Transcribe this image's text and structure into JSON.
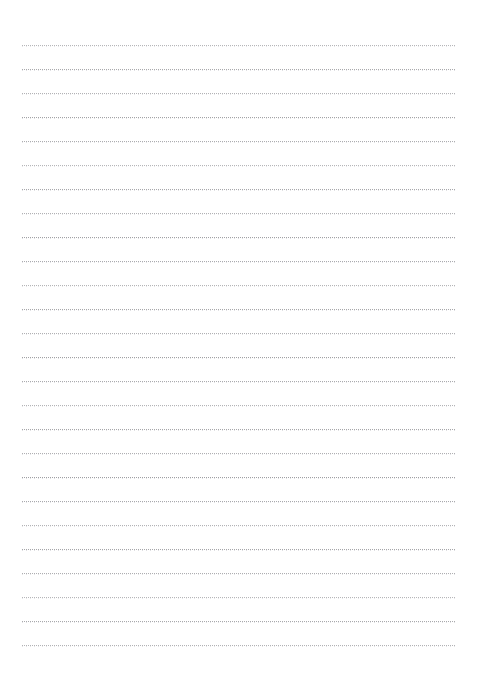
{
  "document": {
    "type": "lined-paper",
    "title": "Blank Lined Notebook Page",
    "page_width": 478,
    "page_height": 678,
    "background_color": "#ffffff",
    "has_text_content": false,
    "body_text": ""
  },
  "ruling": {
    "style": "dotted",
    "line_color": "#9a9a9e",
    "line_count": 26,
    "line_spacing_px": 24,
    "first_line_y": 45,
    "line_start_x": 22,
    "line_end_x": 456,
    "line_thickness_px": 1,
    "margin_left_px": 22,
    "margin_right_px": 22,
    "margin_top_px": 45,
    "margin_bottom_px": 29,
    "lines_y": [
      45,
      69,
      93,
      117,
      141,
      165,
      189,
      213,
      237,
      261,
      285,
      309,
      333,
      357,
      381,
      405,
      429,
      453,
      477,
      501,
      525,
      549,
      573,
      597,
      621,
      645
    ]
  }
}
